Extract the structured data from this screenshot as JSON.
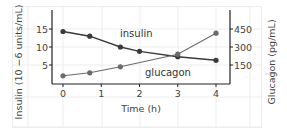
{
  "chart_data": {
    "type": "line",
    "title": "",
    "xlabel": "Time (h)",
    "ylabel": "Insulin (10 −6 units/mL)",
    "ylabel_right": "Glucagon (pg/mL)",
    "x_ticks": [
      "0",
      "1",
      "2",
      "3",
      "4"
    ],
    "y_ticks_left": [
      "5",
      "10",
      "15"
    ],
    "y_ticks_right": [
      "150",
      "300",
      "450"
    ],
    "xlim": [
      0,
      4
    ],
    "ylim_left": [
      0,
      18
    ],
    "ylim_right": [
      0,
      540
    ],
    "grid": true,
    "series": [
      {
        "name": "insulin",
        "axis": "left",
        "x": [
          0,
          0.7,
          1.5,
          2,
          3,
          4
        ],
        "values": [
          14.3,
          13,
          10,
          8.8,
          7.3,
          6.3
        ],
        "color": "#3a3a3a"
      },
      {
        "name": "glucagon",
        "axis": "right",
        "x": [
          0,
          0.7,
          1.5,
          3,
          4
        ],
        "values": [
          60,
          85,
          135,
          240,
          415
        ],
        "color": "#6b6b6b"
      }
    ],
    "annotations": [
      {
        "text": "insulin",
        "near_x": 2.0
      },
      {
        "text": "glucagon",
        "near_x": 2.3
      }
    ]
  }
}
